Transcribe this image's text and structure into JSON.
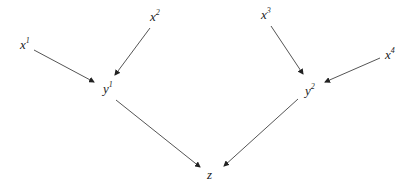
{
  "diagram": {
    "type": "directed-graph",
    "colors": {
      "background": "#ffffff",
      "edge": "#555555",
      "text": "#222222"
    },
    "nodes": [
      {
        "id": "x1",
        "base": "x",
        "sup": "1",
        "x": 20,
        "y": 38
      },
      {
        "id": "x2",
        "base": "x",
        "sup": "2",
        "x": 150,
        "y": 10
      },
      {
        "id": "y1",
        "base": "y",
        "sup": "1",
        "x": 103,
        "y": 82
      },
      {
        "id": "x3",
        "base": "x",
        "sup": "3",
        "x": 261,
        "y": 8
      },
      {
        "id": "x4",
        "base": "x",
        "sup": "4",
        "x": 385,
        "y": 48
      },
      {
        "id": "y2",
        "base": "y",
        "sup": "2",
        "x": 305,
        "y": 84
      },
      {
        "id": "z",
        "base": "z",
        "sup": "",
        "x": 207,
        "y": 168
      }
    ],
    "edges": [
      {
        "from": "x1",
        "to": "y1",
        "x1": 34,
        "y1": 50,
        "x2": 94,
        "y2": 82
      },
      {
        "from": "x2",
        "to": "y1",
        "x1": 150,
        "y1": 28,
        "x2": 115,
        "y2": 75
      },
      {
        "from": "x3",
        "to": "y2",
        "x1": 271,
        "y1": 26,
        "x2": 303,
        "y2": 74
      },
      {
        "from": "x4",
        "to": "y2",
        "x1": 380,
        "y1": 58,
        "x2": 325,
        "y2": 82
      },
      {
        "from": "y1",
        "to": "z",
        "x1": 116,
        "y1": 100,
        "x2": 200,
        "y2": 167
      },
      {
        "from": "y2",
        "to": "z",
        "x1": 298,
        "y1": 99,
        "x2": 224,
        "y2": 166
      }
    ]
  }
}
